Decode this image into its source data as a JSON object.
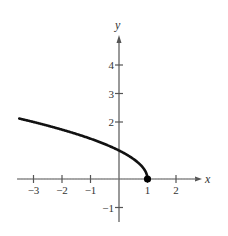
{
  "chart_data": {
    "type": "line",
    "title": "",
    "function": "y = sqrt(1 - x)",
    "xlabel": "x",
    "ylabel": "y",
    "xlim": [
      -3.5,
      2.9
    ],
    "ylim": [
      -1.5,
      5
    ],
    "x_ticks": [
      -3,
      -2,
      -1,
      1,
      2
    ],
    "x_tick_labels": [
      "−3",
      "−2",
      "−1",
      "1",
      "2"
    ],
    "y_ticks": [
      -1,
      2,
      3,
      4
    ],
    "y_tick_labels": [
      "−1",
      "2",
      "3",
      "4"
    ],
    "grid": false,
    "series": [
      {
        "name": "curve",
        "x": [
          -3.5,
          -3,
          -2,
          -1,
          0,
          0.5,
          0.75,
          1
        ],
        "y": [
          2.12,
          2.0,
          1.73,
          1.41,
          1.0,
          0.71,
          0.5,
          0.0
        ],
        "color": "#111111"
      }
    ],
    "annotations": [
      {
        "type": "point",
        "x": 1,
        "y": 0,
        "style": "solid-dot"
      }
    ]
  },
  "colors": {
    "axis": "#555555",
    "curve": "#111111"
  }
}
